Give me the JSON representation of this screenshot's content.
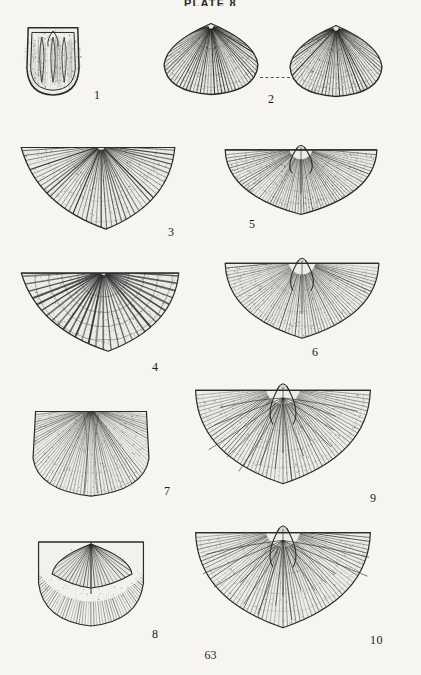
{
  "plate": {
    "header": "PLATE 8",
    "page_number": "63",
    "background_color": "#f6f5f2",
    "ink_color": "#2b2b2b"
  },
  "figures": [
    {
      "number": "1",
      "label_x": 94,
      "label_y": 88,
      "kind": "brachiopod-interior-muscle-field",
      "x": 22,
      "y": 20,
      "w": 62,
      "h": 78,
      "description": "Pedicle valve interior with paired elongate muscle scars"
    },
    {
      "number": "2",
      "label_x": 268,
      "label_y": 92,
      "kind": "brachiopod-costate-valve",
      "x": 160,
      "y": 22,
      "w": 102,
      "h": 74,
      "description": "Costate valve, exterior view"
    },
    {
      "number": "2b",
      "label_x": null,
      "label_y": null,
      "kind": "brachiopod-costate-valve",
      "x": 286,
      "y": 24,
      "w": 100,
      "h": 74,
      "description": "Costate valve, second view joined by dashed leader"
    },
    {
      "number": "3",
      "label_x": 168,
      "label_y": 225,
      "kind": "spiriferid-fan",
      "x": 18,
      "y": 136,
      "w": 160,
      "h": 96,
      "description": "Broad alate spiriferid with bold plications"
    },
    {
      "number": "4",
      "label_x": 152,
      "label_y": 360,
      "kind": "spiriferid-plicate-fan",
      "x": 18,
      "y": 262,
      "w": 164,
      "h": 92,
      "description": "Strongly plicate fan crossed by concentric growth lamellae"
    },
    {
      "number": "5",
      "label_x": 249,
      "label_y": 217,
      "kind": "brachiopod-interior-semicircular",
      "x": 222,
      "y": 140,
      "w": 158,
      "h": 76,
      "description": "Semicircular interior showing dental plates and muscle field"
    },
    {
      "number": "6",
      "label_x": 312,
      "label_y": 345,
      "kind": "brachiopod-striate-semicircle",
      "x": 222,
      "y": 252,
      "w": 160,
      "h": 88,
      "description": "Semicircular valve with fine radial striae"
    },
    {
      "number": "7",
      "label_x": 164,
      "label_y": 484,
      "kind": "brachiopod-shield-valve",
      "x": 28,
      "y": 404,
      "w": 126,
      "h": 94,
      "description": "Shield-shaped valve, fine radial striae with median fold"
    },
    {
      "number": "8",
      "label_x": 152,
      "label_y": 627,
      "kind": "brachiopod-interior-muscle-fan",
      "x": 34,
      "y": 528,
      "w": 114,
      "h": 100,
      "description": "Interior with large flabellate diductor muscle field"
    },
    {
      "number": "9",
      "label_x": 370,
      "label_y": 491,
      "kind": "brachiopod-interior-vascular",
      "x": 192,
      "y": 376,
      "w": 182,
      "h": 110,
      "description": "Wide semicircular interior with radiating vascular markings"
    },
    {
      "number": "10",
      "label_x": 370,
      "label_y": 633,
      "kind": "brachiopod-interior-vascular",
      "x": 192,
      "y": 518,
      "w": 182,
      "h": 112,
      "description": "Wide semicircular interior, cardinal process and vascular trunks"
    }
  ],
  "leader_line": {
    "x": 260,
    "y": 77,
    "width": 30
  }
}
